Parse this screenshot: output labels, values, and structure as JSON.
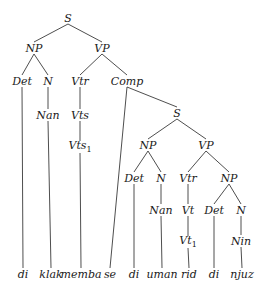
{
  "diagram": {
    "type": "syntax-tree",
    "nodes": [
      {
        "id": "s1",
        "label": "S",
        "x": 68,
        "y": 18
      },
      {
        "id": "np1",
        "label": "NP",
        "x": 34,
        "y": 48
      },
      {
        "id": "vp1",
        "label": "VP",
        "x": 102,
        "y": 48
      },
      {
        "id": "det1",
        "label": "Det",
        "x": 22,
        "y": 81
      },
      {
        "id": "n1",
        "label": "N",
        "x": 48,
        "y": 81
      },
      {
        "id": "vtr1",
        "label": "Vtr",
        "x": 80,
        "y": 81
      },
      {
        "id": "comp",
        "label": "Comp",
        "x": 127,
        "y": 81
      },
      {
        "id": "nan1",
        "label": "Nan",
        "x": 48,
        "y": 115
      },
      {
        "id": "vts",
        "label": "Vts",
        "x": 80,
        "y": 115
      },
      {
        "id": "vts1",
        "label": "Vts",
        "sub": "1",
        "x": 80,
        "y": 147
      },
      {
        "id": "s2",
        "label": "S",
        "x": 177,
        "y": 113
      },
      {
        "id": "np2",
        "label": "NP",
        "x": 148,
        "y": 145
      },
      {
        "id": "vp2",
        "label": "VP",
        "x": 206,
        "y": 145
      },
      {
        "id": "det2",
        "label": "Det",
        "x": 134,
        "y": 178
      },
      {
        "id": "n2",
        "label": "N",
        "x": 161,
        "y": 178
      },
      {
        "id": "vtr2",
        "label": "Vtr",
        "x": 188,
        "y": 178
      },
      {
        "id": "np3",
        "label": "NP",
        "x": 229,
        "y": 178
      },
      {
        "id": "nan2",
        "label": "Nan",
        "x": 161,
        "y": 210
      },
      {
        "id": "vt",
        "label": "Vt",
        "x": 188,
        "y": 210
      },
      {
        "id": "det3",
        "label": "Det",
        "x": 214,
        "y": 210
      },
      {
        "id": "n3",
        "label": "N",
        "x": 241,
        "y": 210
      },
      {
        "id": "vt1",
        "label": "Vt",
        "sub": "1",
        "x": 188,
        "y": 242
      },
      {
        "id": "nin",
        "label": "Nin",
        "x": 241,
        "y": 241
      },
      {
        "id": "w1",
        "label": "di",
        "x": 23,
        "y": 274
      },
      {
        "id": "w2",
        "label": "klak",
        "x": 51,
        "y": 274
      },
      {
        "id": "w3",
        "label": "memba",
        "x": 81,
        "y": 274
      },
      {
        "id": "w4",
        "label": "se",
        "x": 110,
        "y": 274
      },
      {
        "id": "w5",
        "label": "di",
        "x": 134,
        "y": 274
      },
      {
        "id": "w6",
        "label": "uman",
        "x": 162,
        "y": 274
      },
      {
        "id": "w7",
        "label": "rid",
        "x": 189,
        "y": 274
      },
      {
        "id": "w8",
        "label": "di",
        "x": 214,
        "y": 274
      },
      {
        "id": "w9",
        "label": "njuz",
        "x": 242,
        "y": 274
      }
    ],
    "edges": [
      [
        "s1",
        "np1"
      ],
      [
        "s1",
        "vp1"
      ],
      [
        "np1",
        "det1"
      ],
      [
        "np1",
        "n1"
      ],
      [
        "vp1",
        "vtr1"
      ],
      [
        "vp1",
        "comp"
      ],
      [
        "det1",
        "w1"
      ],
      [
        "n1",
        "nan1"
      ],
      [
        "nan1",
        "w2"
      ],
      [
        "vtr1",
        "vts"
      ],
      [
        "vts",
        "vts1"
      ],
      [
        "vts1",
        "w3"
      ],
      [
        "comp",
        "w4"
      ],
      [
        "comp",
        "s2"
      ],
      [
        "s2",
        "np2"
      ],
      [
        "s2",
        "vp2"
      ],
      [
        "np2",
        "det2"
      ],
      [
        "np2",
        "n2"
      ],
      [
        "det2",
        "w5"
      ],
      [
        "n2",
        "nan2"
      ],
      [
        "nan2",
        "w6"
      ],
      [
        "vp2",
        "vtr2"
      ],
      [
        "vp2",
        "np3"
      ],
      [
        "vtr2",
        "vt"
      ],
      [
        "vt",
        "vt1"
      ],
      [
        "vt1",
        "w7"
      ],
      [
        "np3",
        "det3"
      ],
      [
        "np3",
        "n3"
      ],
      [
        "det3",
        "w8"
      ],
      [
        "n3",
        "nin"
      ],
      [
        "nin",
        "w9"
      ]
    ]
  }
}
